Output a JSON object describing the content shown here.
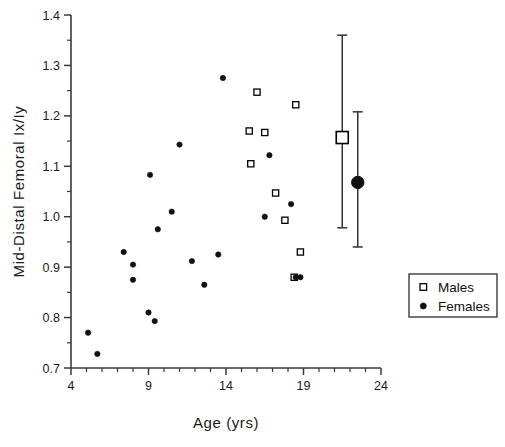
{
  "chart_data": {
    "type": "scatter",
    "title": "",
    "xlabel": "Age  (yrs)",
    "ylabel": "Mid-Distal  Femoral  Ix/Iy",
    "xlim": [
      4,
      24
    ],
    "ylim": [
      0.7,
      1.4
    ],
    "xticks": [
      4,
      9,
      14,
      19,
      24
    ],
    "xtick_labels": [
      "4",
      "9",
      "14",
      "19",
      "24"
    ],
    "xtick_minor_step": 1,
    "yticks": [
      0.7,
      0.8,
      0.9,
      1.0,
      1.1,
      1.2,
      1.3,
      1.4
    ],
    "ytick_labels": [
      "0.7",
      "0.8",
      "0.9",
      "1.0",
      "1.1",
      "1.2",
      "1.3",
      "1.4"
    ],
    "ytick_minor_step": 0.05,
    "grid": false,
    "legend_position": "lower-right",
    "series": [
      {
        "name": "Males",
        "marker": "open-square",
        "color": "#000000",
        "points": [
          [
            16.0,
            1.247
          ],
          [
            18.5,
            1.222
          ],
          [
            15.5,
            1.17
          ],
          [
            16.5,
            1.167
          ],
          [
            15.6,
            1.105
          ],
          [
            17.2,
            1.047
          ],
          [
            17.8,
            0.993
          ],
          [
            18.8,
            0.93
          ],
          [
            18.4,
            0.88
          ]
        ]
      },
      {
        "name": "Females",
        "marker": "filled-circle",
        "color": "#111111",
        "points": [
          [
            5.1,
            0.77
          ],
          [
            5.7,
            0.728
          ],
          [
            7.4,
            0.93
          ],
          [
            8.0,
            0.905
          ],
          [
            8.0,
            0.875
          ],
          [
            9.0,
            0.81
          ],
          [
            9.4,
            0.793
          ],
          [
            9.1,
            1.083
          ],
          [
            9.6,
            0.975
          ],
          [
            10.5,
            1.01
          ],
          [
            11.0,
            1.143
          ],
          [
            11.8,
            0.912
          ],
          [
            12.6,
            0.865
          ],
          [
            13.8,
            1.275
          ],
          [
            13.5,
            0.925
          ],
          [
            16.8,
            1.122
          ],
          [
            16.5,
            1.0
          ],
          [
            18.2,
            1.025
          ],
          [
            18.8,
            0.88
          ],
          [
            18.5,
            0.88
          ]
        ]
      }
    ],
    "summary": [
      {
        "name": "Males",
        "marker": "open-square",
        "x": 21.5,
        "mean": 1.157,
        "upper": 1.36,
        "lower": 0.978
      },
      {
        "name": "Females",
        "marker": "filled-circle",
        "x": 22.5,
        "mean": 1.068,
        "upper": 1.208,
        "lower": 0.94
      }
    ],
    "legend": [
      {
        "label": "Males",
        "marker": "open-square"
      },
      {
        "label": "Females",
        "marker": "filled-circle"
      }
    ]
  }
}
